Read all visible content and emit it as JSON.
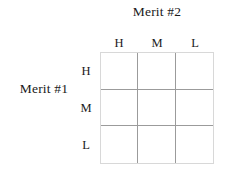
{
  "figure": {
    "type": "matrix-grid",
    "title_column_axis": "Merit #2",
    "title_row_axis": "Merit #1",
    "column_headers": [
      "H",
      "M",
      "L"
    ],
    "row_headers": [
      "H",
      "M",
      "L"
    ],
    "cells": [
      [
        "",
        "",
        ""
      ],
      [
        "",
        "",
        ""
      ],
      [
        "",
        "",
        ""
      ]
    ],
    "colors": {
      "background": "#ffffff",
      "text": "#1a1a1a",
      "grid_line": "#9b9b9b",
      "grid_border": "#d8d8d8"
    }
  }
}
